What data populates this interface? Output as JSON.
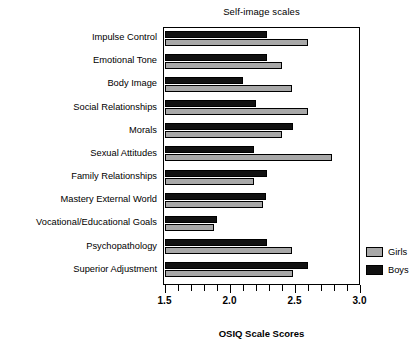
{
  "chart_data": {
    "type": "bar",
    "orientation": "horizontal",
    "title": "Self-image scales",
    "xlabel": "OSIQ Scale Scores",
    "ylabel": "",
    "xlim": [
      1.5,
      3.0
    ],
    "xticks": [
      1.5,
      2.0,
      2.5,
      3.0
    ],
    "xticklabels": [
      "1.5",
      "2.0",
      "2.5",
      "3.0"
    ],
    "minor_tick_step": 0.1,
    "grid": false,
    "legend_position": "right",
    "categories": [
      "Impulse Control",
      "Emotional Tone",
      "Body Image",
      "Social Relationships",
      "Morals",
      "Sexual Attitudes",
      "Family Relationships",
      "Mastery External World",
      "Vocational/Educational Goals",
      "Psychopathology",
      "Superior Adjustment"
    ],
    "series": [
      {
        "name": "Boys",
        "color": "#111111",
        "values": [
          2.29,
          2.29,
          2.1,
          2.2,
          2.49,
          2.19,
          2.29,
          2.28,
          1.9,
          2.29,
          2.6
        ]
      },
      {
        "name": "Girls",
        "color": "#a8a8a8",
        "values": [
          2.6,
          2.4,
          2.48,
          2.6,
          2.4,
          2.79,
          2.19,
          2.26,
          1.88,
          2.48,
          2.49
        ]
      }
    ]
  },
  "legend": {
    "entries": [
      {
        "label": "Girls",
        "color": "#a8a8a8"
      },
      {
        "label": "Boys",
        "color": "#111111"
      }
    ]
  }
}
